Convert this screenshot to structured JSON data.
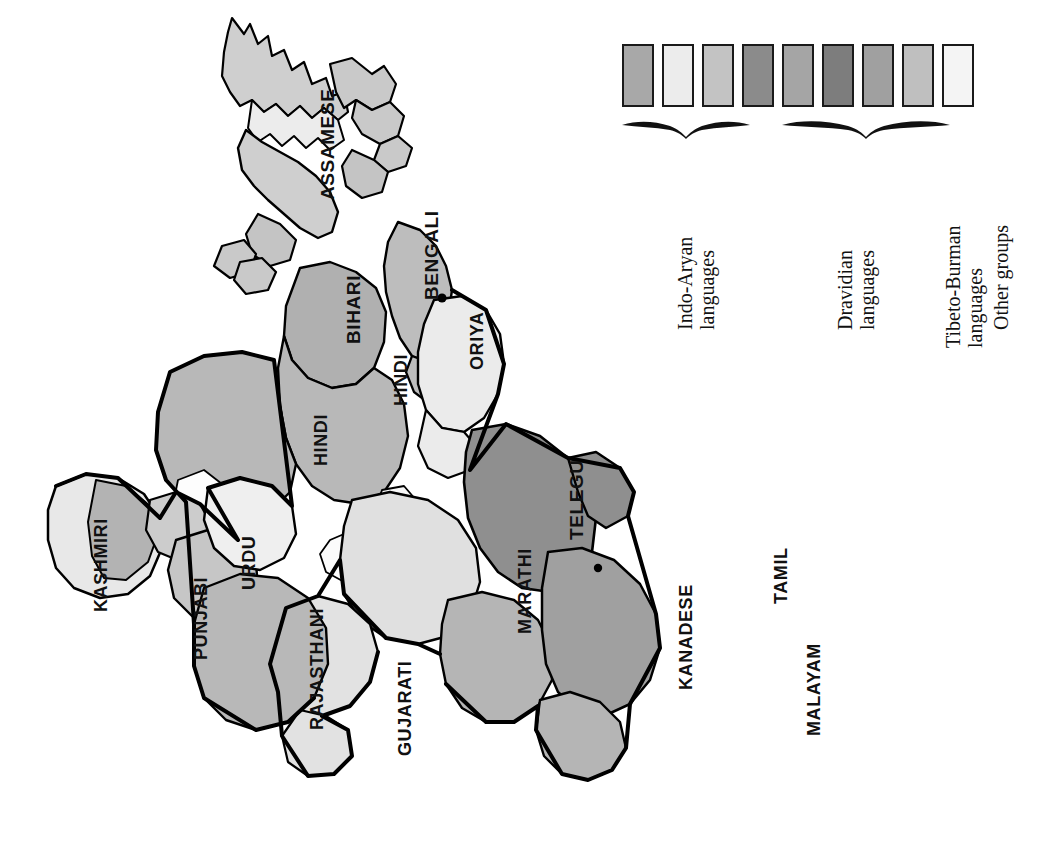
{
  "figure": {
    "kind": "thematic-map",
    "background_color": "#ffffff",
    "rotation_note": "whole figure rendered rotated 90 degrees"
  },
  "map": {
    "outline_color": "#000000",
    "border_color": "#111111",
    "city_dots": 2,
    "regions": [
      {
        "id": "kashmiri",
        "label": "KASHMIRI",
        "group": "Indo-Aryan",
        "fill": "#b3b3b3"
      },
      {
        "id": "punjabi",
        "label": "PUNJABI",
        "group": "Indo-Aryan",
        "fill": "#c6c6c6"
      },
      {
        "id": "urdu",
        "label": "URDU",
        "group": "Indo-Aryan",
        "fill": "#efefef"
      },
      {
        "id": "rajasthani",
        "label": "RAJASTHANI",
        "group": "Indo-Aryan",
        "fill": "#b8b8b8"
      },
      {
        "id": "gujarati",
        "label": "GUJARATI",
        "group": "Indo-Aryan",
        "fill": "#e2e2e2"
      },
      {
        "id": "hindi-west",
        "label": "HINDI",
        "group": "Indo-Aryan",
        "fill": "#b8b8b8"
      },
      {
        "id": "hindi-east",
        "label": "HINDI",
        "group": "Indo-Aryan",
        "fill": "#b8b8b8"
      },
      {
        "id": "bihari",
        "label": "BIHARI",
        "group": "Indo-Aryan",
        "fill": "#b0b0b0"
      },
      {
        "id": "bengali",
        "label": "BENGALI",
        "group": "Indo-Aryan",
        "fill": "#bdbdbd"
      },
      {
        "id": "oriya",
        "label": "ORIYA",
        "group": "Indo-Aryan",
        "fill": "#ebebeb"
      },
      {
        "id": "marathi",
        "label": "MARATHI",
        "group": "Indo-Aryan",
        "fill": "#e0e0e0"
      },
      {
        "id": "assamese",
        "label": "ASSAMESE",
        "group": "Tibeto-Burman",
        "fill": "#cfcfcf"
      },
      {
        "id": "telegu",
        "label": "TELEGU",
        "group": "Dravidian",
        "fill": "#8f8f8f"
      },
      {
        "id": "kanadese",
        "label": "KANADESE",
        "group": "Dravidian",
        "fill": "#b5b5b5"
      },
      {
        "id": "tamil",
        "label": "TAMIL",
        "group": "Dravidian",
        "fill": "#a0a0a0"
      },
      {
        "id": "malayam",
        "label": "MALAYAM",
        "group": "Dravidian",
        "fill": "#b5b5b5"
      }
    ],
    "labels": {
      "kashmiri": "KASHMIRI",
      "punjabi": "PUNJABI",
      "urdu": "URDU",
      "rajasthani": "RAJASTHANI",
      "gujarati": "GUJARATI",
      "hindi_west": "HINDI",
      "hindi_east": "HINDI",
      "bihari": "BIHARI",
      "bengali": "BENGALI",
      "oriya": "ORIYA",
      "marathi": "MARATHI",
      "assamese": "ASSAMESE",
      "telegu": "TELEGU",
      "kanadese": "KANADESE",
      "tamil": "TAMIL",
      "malayam": "MALAYAM"
    }
  },
  "legend": {
    "swatch_count": 9,
    "swatches": [
      {
        "index": 1,
        "color": "#a8a8a8",
        "group": "Indo-Aryan languages"
      },
      {
        "index": 2,
        "color": "#ececec",
        "group": "Indo-Aryan languages"
      },
      {
        "index": 3,
        "color": "#c3c3c3",
        "group": "Indo-Aryan languages"
      },
      {
        "index": 4,
        "color": "#8b8b8b",
        "group": "Dravidian languages"
      },
      {
        "index": 5,
        "color": "#a5a5a5",
        "group": "Dravidian languages"
      },
      {
        "index": 6,
        "color": "#7d7d7d",
        "group": "Dravidian languages"
      },
      {
        "index": 7,
        "color": "#a0a0a0",
        "group": "Dravidian languages"
      },
      {
        "index": 8,
        "color": "#bfbfbf",
        "group": "Tibeto-Burman languages"
      },
      {
        "index": 9,
        "color": "#f4f4f4",
        "group": "Other groups"
      }
    ],
    "groups": [
      {
        "id": "indo-aryan",
        "line1": "Indo-Aryan",
        "line2": "languages",
        "braced": true,
        "spans": [
          1,
          3
        ]
      },
      {
        "id": "dravidian",
        "line1": "Dravidian",
        "line2": "languages",
        "braced": true,
        "spans": [
          4,
          7
        ]
      },
      {
        "id": "tibeto-burman",
        "line1": "Tibeto-Burman",
        "line2": "languages",
        "braced": false,
        "spans": [
          8,
          8
        ]
      },
      {
        "id": "other",
        "line1": "Other groups",
        "line2": "",
        "braced": false,
        "spans": [
          9,
          9
        ]
      }
    ]
  }
}
